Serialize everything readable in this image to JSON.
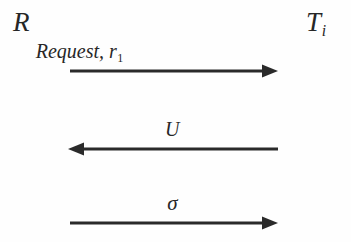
{
  "figure": {
    "type": "message-sequence-diagram",
    "background_color": "#fefefe",
    "ink_color": "#2a2a2a"
  },
  "actors": [
    {
      "id": "requester",
      "label": "R",
      "subscript": "",
      "side": "left"
    },
    {
      "id": "target",
      "label": "T",
      "subscript": "i",
      "side": "right"
    }
  ],
  "messages": [
    {
      "index": 1,
      "label_main": "Request, r",
      "label_subscript": "1",
      "label_greek": "",
      "direction": "right",
      "from": "R",
      "to": "T_i"
    },
    {
      "index": 2,
      "label_main": "U",
      "label_subscript": "",
      "label_greek": "",
      "direction": "left",
      "from": "T_i",
      "to": "R"
    },
    {
      "index": 3,
      "label_main": "",
      "label_subscript": "",
      "label_greek": "σ",
      "direction": "right",
      "from": "R",
      "to": "T_i"
    }
  ]
}
